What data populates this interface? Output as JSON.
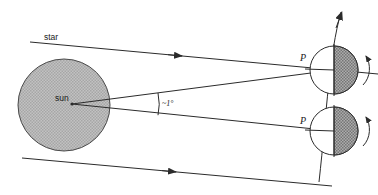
{
  "figure": {
    "type": "astronomy-diagram",
    "background_color": "#ffffff",
    "line_color": "#2b2b2b",
    "sun_fill": "#b8b8b8",
    "earth_night_fill": "#8f8f8f",
    "earth_day_fill": "#ffffff"
  },
  "labels": {
    "star": "star",
    "sun": "sun",
    "angle": "~1°",
    "point_upper": "P",
    "point_lower": "P"
  },
  "icons": {
    "star_ray_top": "arrow-right-icon",
    "star_ray_bottom": "arrow-right-icon",
    "orbit_arrow": "arrow-up-icon",
    "rotation_upper": "rotation-arrow-icon",
    "rotation_lower": "rotation-arrow-icon"
  },
  "geometry": {
    "sun": {
      "cx": 64,
      "cy": 105,
      "r": 46
    },
    "earth_upper": {
      "cx": 334,
      "cy": 70,
      "r": 24
    },
    "earth_lower": {
      "cx": 334,
      "cy": 131,
      "r": 24
    },
    "angle_value_degrees": 1
  }
}
